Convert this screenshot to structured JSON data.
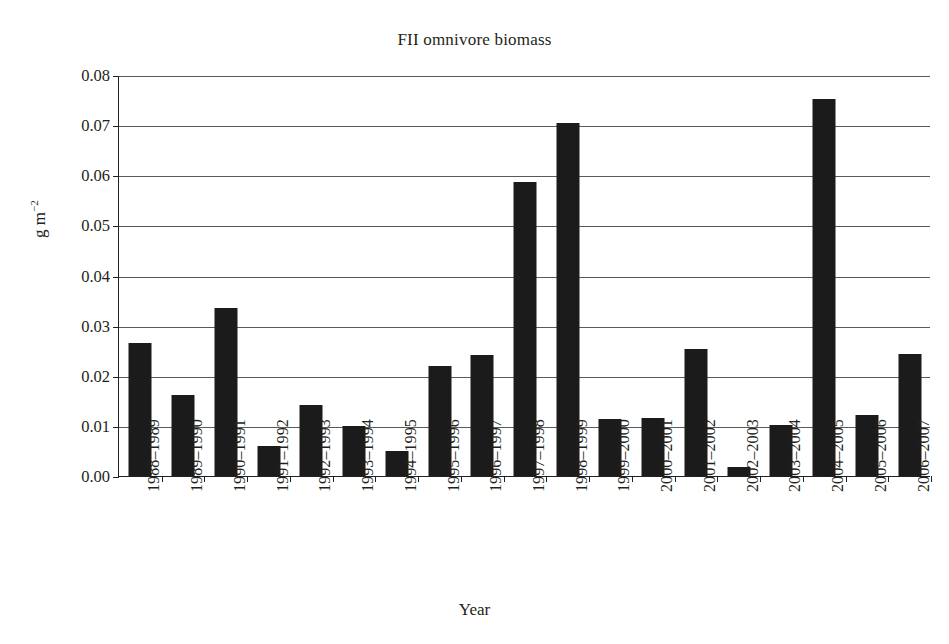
{
  "chart_data": {
    "type": "bar",
    "title": "FII omnivore biomass",
    "xlabel": "Year",
    "ylabel": "g m−2",
    "ylabel_base": "g m",
    "ylabel_exponent": "−2",
    "ylim": [
      0,
      0.08
    ],
    "ytick_step": 0.01,
    "ytick_labels": [
      "0.08",
      "0.07",
      "0.06",
      "0.05",
      "0.04",
      "0.03",
      "0.02",
      "0.01",
      "0.00"
    ],
    "ytick_values": [
      0.08,
      0.07,
      0.06,
      0.05,
      0.04,
      0.03,
      0.02,
      0.01,
      0.0
    ],
    "grid": true,
    "grid_axis": "y",
    "legend": null,
    "legend_position": "none",
    "bar_color": "#1b1b1b",
    "categories": [
      "1988–1989",
      "1989–1990",
      "1990–1991",
      "1991–1992",
      "1992–1993",
      "1993–1994",
      "1994–1995",
      "1995–1996",
      "1996–1997",
      "1997–1998",
      "1998–1999",
      "1999–2000",
      "2000–2001",
      "2001–2002",
      "2002–2003",
      "2003–2004",
      "2004–2005",
      "2005–2006",
      "2006–2007"
    ],
    "values": [
      0.0265,
      0.0161,
      0.0336,
      0.006,
      0.0141,
      0.0099,
      0.0049,
      0.0219,
      0.0241,
      0.0587,
      0.0705,
      0.0114,
      0.0116,
      0.0254,
      0.0017,
      0.0102,
      0.0753,
      0.0121,
      0.0243
    ]
  }
}
